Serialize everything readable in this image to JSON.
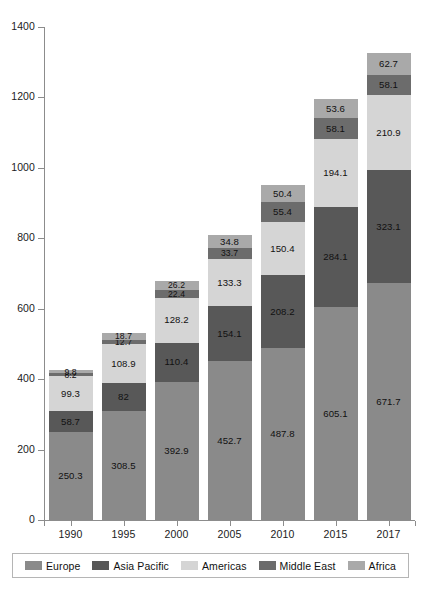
{
  "chart_data": {
    "type": "bar",
    "stacked": true,
    "title": "",
    "subtitle": "",
    "xlabel": "",
    "ylabel": "",
    "ylim": [
      0,
      1400
    ],
    "ytick_step": 200,
    "ytick_labels": [
      "1400",
      "1200",
      "1000",
      "800",
      "600",
      "400",
      "200",
      "0"
    ],
    "ytick_values": [
      1400,
      1200,
      1000,
      800,
      600,
      400,
      200,
      0
    ],
    "grid": false,
    "legend_position": "bottom",
    "categories": [
      "1990",
      "1995",
      "2000",
      "2005",
      "2010",
      "2015",
      "2017"
    ],
    "series": [
      {
        "name": "Europe",
        "color": "#8a8a8a",
        "values": [
          250.3,
          308.5,
          392.9,
          452.7,
          487.8,
          605.1,
          671.7
        ],
        "labels": [
          "250.3",
          "308.5",
          "392.9",
          "452.7",
          "487.8",
          "605.1",
          "671.7"
        ]
      },
      {
        "name": "Asia Pacific",
        "color": "#585858",
        "values": [
          58.7,
          82,
          110.4,
          154.1,
          208.2,
          284.1,
          323.1
        ],
        "labels": [
          "58.7",
          "82",
          "110.4",
          "154.1",
          "208.2",
          "284.1",
          "323.1"
        ]
      },
      {
        "name": "Americas",
        "color": "#d5d5d5",
        "values": [
          99.3,
          108.9,
          128.2,
          133.3,
          150.4,
          194.1,
          210.9
        ],
        "labels": [
          "99.3",
          "108.9",
          "128.2",
          "133.3",
          "150.4",
          "194.1",
          "210.9"
        ]
      },
      {
        "name": "Middle East",
        "color": "#6c6c6c",
        "values": [
          8.2,
          12.7,
          22.4,
          33.7,
          55.4,
          58.1,
          58.1
        ],
        "labels": [
          "8.2",
          "12.7",
          "22.4",
          "33.7",
          "55.4",
          "58.1",
          "58.1"
        ]
      },
      {
        "name": "Africa",
        "color": "#a9a9a9",
        "values": [
          9.8,
          18.7,
          26.2,
          34.8,
          50.4,
          53.6,
          62.7
        ],
        "labels": [
          "9.8",
          "18.7",
          "26.2",
          "34.8",
          "50.4",
          "53.6",
          "62.7"
        ]
      }
    ],
    "totals": [
      426.3,
      530.8,
      680.1,
      808.6,
      952.2,
      1195.0,
      1326.5
    ]
  },
  "legend": {
    "entries": [
      {
        "label": "Europe",
        "color": "#8a8a8a"
      },
      {
        "label": "Asia Pacific",
        "color": "#585858"
      },
      {
        "label": "Americas",
        "color": "#d5d5d5"
      },
      {
        "label": "Middle East",
        "color": "#6c6c6c"
      },
      {
        "label": "Africa",
        "color": "#a9a9a9"
      }
    ]
  },
  "axis": {
    "y_max": 1400,
    "y_min": 0
  }
}
